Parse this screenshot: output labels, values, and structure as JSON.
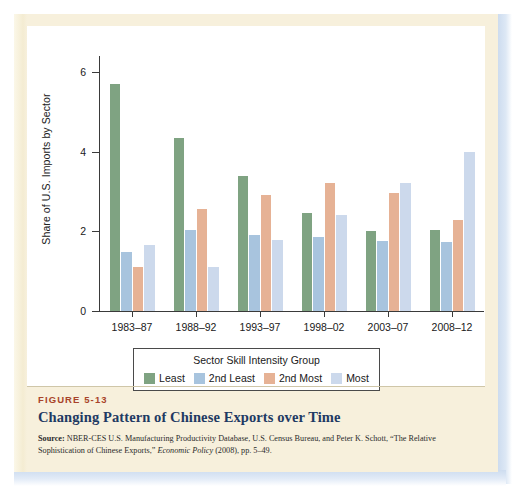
{
  "colors": {
    "page_background": "#f7f0dc",
    "panel_background": "#ffffff",
    "axis": "#3a3a3a",
    "figure_number": "#a8442a",
    "title": "#1e3a63",
    "edge_shadow": "#cddcef"
  },
  "caption": {
    "figure_number": "FIGURE 5-13",
    "title": "Changing Pattern of Chinese Exports over Time",
    "source_label": "Source:",
    "source_text_1": " NBER-CES U.S. Manufacturing Productivity Database, U.S. Census Bureau, and Peter K. Schott,",
    "source_text_2": "“The Relative Sophistication of Chinese Exports,” ",
    "source_italic": "Economic Policy",
    "source_text_3": " (2008), pp. 5–49."
  },
  "legend": {
    "title": "Sector Skill Intensity Group",
    "items": [
      {
        "label": "Least",
        "color": "#7fa382"
      },
      {
        "label": "2nd Least",
        "color": "#a8c4de"
      },
      {
        "label": "2nd Most",
        "color": "#e6b295"
      },
      {
        "label": "Most",
        "color": "#ccd9ec"
      }
    ]
  },
  "chart_data": {
    "type": "bar",
    "title": "Changing Pattern of Chinese Exports over Time",
    "xlabel": "",
    "ylabel": "Share of U.S. Imports by Sector",
    "categories": [
      "1983–87",
      "1988–92",
      "1993–97",
      "1998–02",
      "2003–07",
      "2008–12"
    ],
    "ylim": [
      0,
      6.4
    ],
    "yticks": [
      0,
      2,
      4,
      6
    ],
    "ytick_labels": [
      "0",
      "2",
      "4",
      "6"
    ],
    "grid": false,
    "legend_position": "bottom",
    "series": [
      {
        "name": "Least",
        "color": "#7fa382",
        "values": [
          5.7,
          4.35,
          3.4,
          2.45,
          2.0,
          2.03
        ]
      },
      {
        "name": "2nd Least",
        "color": "#a8c4de",
        "values": [
          1.48,
          2.03,
          1.92,
          1.85,
          1.75,
          1.72
        ]
      },
      {
        "name": "2nd Most",
        "color": "#e6b295",
        "values": [
          1.1,
          2.55,
          2.9,
          3.22,
          2.95,
          2.28
        ]
      },
      {
        "name": "Most",
        "color": "#ccd9ec",
        "values": [
          1.65,
          1.1,
          1.78,
          2.4,
          3.22,
          3.98
        ]
      }
    ]
  }
}
